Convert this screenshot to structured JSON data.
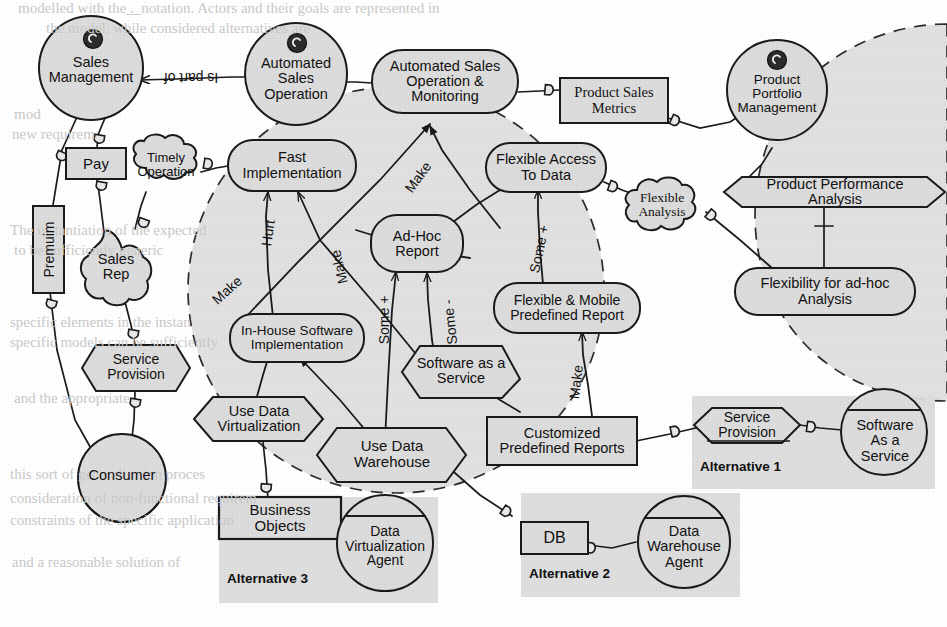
{
  "diagram": {
    "notation": "i-star",
    "colors": {
      "fill": "#dcdcdc",
      "stroke": "#1a1a1a",
      "boundary_stroke": "#2b2b2b",
      "paper": "#ffffff",
      "ghost_text": "#c9c9c9"
    }
  },
  "actors": [
    {
      "id": "sales-management",
      "label": "Sales\nManagement",
      "type": "actor-circle",
      "has_role_icon": true
    },
    {
      "id": "automated-sales-operation",
      "label": "Automated\nSales\nOperation",
      "type": "actor-circle",
      "has_role_icon": true
    },
    {
      "id": "product-portfolio-management",
      "label": "Product\nPortfolio\nManagement",
      "type": "actor-circle",
      "has_role_icon": true
    },
    {
      "id": "sales-rep",
      "label": "Sales\nRep",
      "type": "role-cloud"
    },
    {
      "id": "consumer",
      "label": "Consumer",
      "type": "agent-circle"
    },
    {
      "id": "software-as-a-service-agent",
      "label": "Software\nAs a\nService",
      "type": "agent-circle"
    },
    {
      "id": "data-warehouse-agent",
      "label": "Data\nWarehouse\nAgent",
      "type": "agent-circle"
    },
    {
      "id": "data-virtualization-agent",
      "label": "Data\nVirtualization\nAgent",
      "type": "agent-circle"
    }
  ],
  "goals": [
    {
      "id": "automated-sales-operation-monitoring",
      "label": "Automated Sales\nOperation &\nMonitoring"
    },
    {
      "id": "fast-implementation",
      "label": "Fast\nImplementation"
    },
    {
      "id": "ad-hoc-report",
      "label": "Ad-Hoc\nReport"
    },
    {
      "id": "flexible-access-to-data",
      "label": "Flexible Access\nTo Data"
    },
    {
      "id": "in-house-software-implementation",
      "label": "In-House Software\nImplementation"
    },
    {
      "id": "flexible-mobile-predefined-report",
      "label": "Flexible & Mobile\nPredefined Report"
    },
    {
      "id": "flexibility-for-ad-hoc-analysis",
      "label": "Flexibility for ad-hoc\nAnalysis"
    }
  ],
  "softgoals": [
    {
      "id": "timely-operation",
      "label": "Timely\nOperation"
    },
    {
      "id": "flexible-analysis",
      "label": "Flexible\nAnalysis"
    }
  ],
  "tasks": [
    {
      "id": "service-provision-left",
      "label": "Service\nProvision"
    },
    {
      "id": "software-as-a-service-task",
      "label": "Software as a\nService"
    },
    {
      "id": "use-data-virtualization",
      "label": "Use Data\nVirtualization"
    },
    {
      "id": "use-data-warehouse",
      "label": "Use Data\nWarehouse"
    },
    {
      "id": "product-performance-analysis",
      "label": "Product Performance\nAnalysis"
    },
    {
      "id": "service-provision-alt1",
      "label": "Service\nProvision"
    }
  ],
  "resources": [
    {
      "id": "pay",
      "label": "Pay"
    },
    {
      "id": "premuim",
      "label": "Premuim",
      "rotated": true
    },
    {
      "id": "product-sales-metrics",
      "label": "Product Sales\nMetrics"
    },
    {
      "id": "customized-predefined-reports",
      "label": "Customized\nPredefined Reports"
    },
    {
      "id": "business-objects",
      "label": "Business\nObjects"
    },
    {
      "id": "db",
      "label": "DB"
    }
  ],
  "groups": [
    {
      "id": "alternative-1",
      "label": "Alternative 1"
    },
    {
      "id": "alternative-2",
      "label": "Alternative 2"
    },
    {
      "id": "alternative-3",
      "label": "Alternative 3"
    }
  ],
  "edge_labels": [
    {
      "id": "is-part-of",
      "label": "Is part of",
      "rotated180": true
    },
    {
      "id": "contrib-hurt-inhouse-fast",
      "label": "Hurt"
    },
    {
      "id": "contrib-make-saas-fast",
      "label": "Make"
    },
    {
      "id": "contrib-make-inhouse-asom",
      "label": "Make"
    },
    {
      "id": "contrib-make-adhoc-flexaccess",
      "label": "Make"
    },
    {
      "id": "contrib-some-plus-udw-adhoc",
      "label": "Some +"
    },
    {
      "id": "contrib-some-minus-saas-adhoc",
      "label": "Some -"
    },
    {
      "id": "contrib-some-plus-fmpr-flexaccess",
      "label": "Some +"
    },
    {
      "id": "contrib-make-cpr-fmpr",
      "label": "Make"
    }
  ],
  "background_text": {
    "lines": [
      {
        "text": "modelled with the  ̲.  ̲ notation. Actors and their goals are represented in",
        "x": 18,
        "y": 2
      },
      {
        "text": "the          model, while      considered alternatives are",
        "x": 46,
        "y": 22
      },
      {
        "text": "mod",
        "x": 14,
        "y": 108
      },
      {
        "text": "new requirem",
        "x": 12,
        "y": 128
      },
      {
        "text": "The   instantiation of the expected",
        "x": 10,
        "y": 224
      },
      {
        "text": "to be  sufficiently    generic",
        "x": 14,
        "y": 244
      },
      {
        "text": "specific elements in the   instan",
        "x": 10,
        "y": 316
      },
      {
        "text": "specific models can be  sufficiently",
        "x": 10,
        "y": 336
      },
      {
        "text": "and    the     appropriate",
        "x": 14,
        "y": 392
      },
      {
        "text": "this sort of  generalisation  proces",
        "x": 10,
        "y": 468
      },
      {
        "text": "consideration  of   non-functional   requirem",
        "x": 10,
        "y": 492
      },
      {
        "text": "constraints  of   the    specific   application",
        "x": 10,
        "y": 514
      },
      {
        "text": "and  a  reasonable  solution  of",
        "x": 12,
        "y": 556
      }
    ]
  }
}
